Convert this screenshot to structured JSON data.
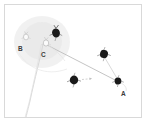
{
  "figure": {
    "width": 146,
    "height": 122,
    "background_color": "#ffffff",
    "frame": {
      "border_color": "#d9d9d9",
      "fill_color": "#ffffff",
      "x": 4,
      "y": 4,
      "width": 138,
      "height": 114
    }
  },
  "colors": {
    "blob_dark": "#1a1a1a",
    "blob_mid": "#2b2b2b",
    "halo_gray": "#ececec",
    "line_gray": "#bdbdbd",
    "line_light": "#d6d6d6",
    "label_text": "#3a3a3a",
    "outline_gray": "#c8c8c8"
  },
  "region": {
    "name": "gray-halo-region",
    "shape": "ellipse",
    "center_x": 41,
    "center_y": 41,
    "radius_x": 28,
    "radius_y": 26,
    "fill": "#ececec"
  },
  "labels": [
    {
      "id": "B",
      "text": "B",
      "x": 18,
      "y": 45
    },
    {
      "id": "C",
      "text": "C",
      "x": 41,
      "y": 51
    },
    {
      "id": "A",
      "text": "A",
      "x": 121,
      "y": 91
    }
  ],
  "objects": [
    {
      "name": "dark-blob-top",
      "x": 52,
      "y": 30,
      "rx": 4.0,
      "ry": 4.6,
      "fill": "#1a1a1a",
      "rotation": -18
    },
    {
      "name": "marked-node-b",
      "x": 24,
      "y": 35,
      "rx": 2.6,
      "ry": 2.9,
      "fill": "none",
      "outline": "#bdbdbd"
    },
    {
      "name": "marked-node-c",
      "x": 44,
      "y": 41,
      "rx": 2.8,
      "ry": 3.1,
      "fill": "none",
      "outline": "#bdbdbd"
    },
    {
      "name": "dark-blob-right-upper",
      "x": 103,
      "y": 52,
      "rx": 4.0,
      "ry": 4.2,
      "fill": "#1a1a1a",
      "rotation": 12
    },
    {
      "name": "dark-blob-center-lower",
      "x": 71,
      "y": 78,
      "rx": 4.2,
      "ry": 4.4,
      "fill": "#1a1a1a",
      "rotation": 5
    },
    {
      "name": "dark-blob-node-a",
      "x": 116,
      "y": 79,
      "rx": 3.4,
      "ry": 3.6,
      "fill": "#1a1a1a",
      "rotation": -8
    }
  ],
  "connections": [
    {
      "name": "link-c-to-a",
      "from": "marked-node-c",
      "to": "dark-blob-node-a",
      "x1": 46,
      "y1": 44,
      "x2": 114,
      "y2": 78
    },
    {
      "name": "link-upper-right-to-a",
      "from": "dark-blob-right-upper",
      "to": "dark-blob-node-a",
      "x1": 104,
      "y1": 56,
      "x2": 116,
      "y2": 76
    },
    {
      "name": "trajectory-curve-b",
      "description": "curved path descending from node B toward lower-left"
    },
    {
      "name": "arrow-from-center-blob",
      "description": "short dashed arrow pointing right",
      "x1": 78,
      "y1": 77,
      "x2": 91,
      "y2": 76
    }
  ]
}
